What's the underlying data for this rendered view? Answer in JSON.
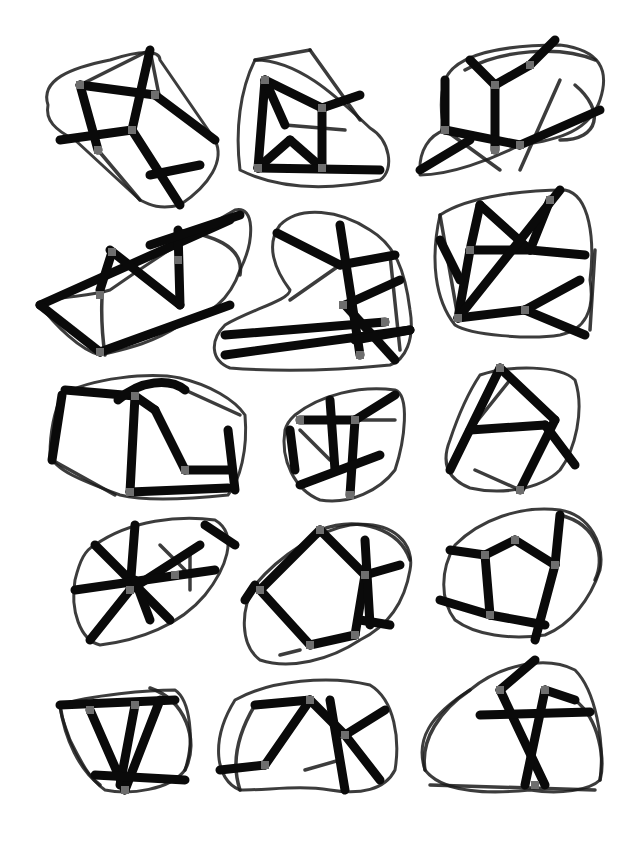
{
  "artwork": {
    "background": "#ffffff",
    "ink": "#0a0a0a",
    "joint_color": "#6e6e6e",
    "layout": {
      "columns": 3,
      "rows": 5
    },
    "shapes": [
      {
        "name": "shape-r1-c1",
        "outline": "M48,105 C40,80 70,68 110,60 C140,50 160,50 160,60 L215,140 C225,160 210,185 180,205 C160,210 150,205 140,200 L75,140 C55,130 45,120 48,105 Z",
        "thick": [
          "M132,130 L150,50",
          "M132,130 L60,140",
          "M132,130 L180,205",
          "M80,85 L98,150",
          "M80,85 L155,95",
          "M155,95 L215,140",
          "M150,175 L200,165"
        ],
        "thin": [
          "M150,50 L160,100",
          "M80,85 L150,50",
          "M98,150 L140,200"
        ],
        "joints": [
          [
            132,
            130
          ],
          [
            80,
            85
          ],
          [
            155,
            95
          ],
          [
            98,
            150
          ]
        ]
      },
      {
        "name": "shape-r2-c1",
        "outline": "M255,60 C240,90 235,130 240,170 C280,190 330,190 380,180 C395,170 390,140 370,128 C340,100 300,60 255,60 Z",
        "thick": [
          "M258,168 L265,80",
          "M265,80 L322,108",
          "M322,108 L360,95",
          "M322,108 L322,168",
          "M258,168 L290,140",
          "M290,140 L322,168",
          "M258,168 L380,170",
          "M265,80 L285,125"
        ],
        "thin": [
          "M255,60 L310,50",
          "M310,50 L360,120",
          "M285,125 L345,130"
        ],
        "joints": [
          [
            265,
            80
          ],
          [
            322,
            108
          ],
          [
            258,
            168
          ],
          [
            322,
            168
          ]
        ]
      },
      {
        "name": "shape-r3-c1",
        "outline": "M445,80 C455,55 500,45 560,45 C600,50 610,70 600,100 C590,130 560,140 520,145 C490,160 450,175 420,175 C418,150 430,135 445,130 C440,115 440,95 445,80 Z",
        "thick": [
          "M495,85 L470,60",
          "M495,85 L530,65",
          "M495,85 L495,150",
          "M530,65 L555,40",
          "M445,80 L445,130",
          "M445,130 L520,145",
          "M520,145 L600,110",
          "M420,170 L470,140"
        ],
        "thin": [
          "M465,70 C500,50 560,45 595,60",
          "M560,80 L520,170",
          "M445,130 L500,170",
          "M575,85 C605,110 600,140 560,140"
        ],
        "joints": [
          [
            495,
            85
          ],
          [
            530,
            65
          ],
          [
            445,
            130
          ],
          [
            520,
            145
          ],
          [
            495,
            150
          ]
        ]
      },
      {
        "name": "shape-r1-c2",
        "outline": "M40,305 C55,295 85,298 110,290 C160,255 200,230 235,210 C255,205 255,240 240,270 C230,300 210,315 180,325 C150,345 120,350 100,355 C80,350 55,325 40,305 Z",
        "thick": [
          "M40,305 L230,220",
          "M40,305 L100,352",
          "M100,352 L230,305",
          "M110,250 L180,305",
          "M180,305 L178,230",
          "M100,290 L112,252",
          "M150,245 L240,215"
        ],
        "thin": [
          "M110,252 C100,280 100,320 105,355",
          "M178,230 C210,235 245,245 240,275"
        ],
        "joints": [
          [
            112,
            252
          ],
          [
            178,
            260
          ],
          [
            100,
            295
          ],
          [
            100,
            352
          ]
        ]
      },
      {
        "name": "shape-r2-c2",
        "outline": "M280,225 C300,205 340,210 370,230 C395,245 405,270 410,310 C415,340 405,360 390,365 C340,370 280,372 230,368 C210,360 210,340 225,325 C250,310 290,300 290,290 C275,270 265,245 280,225 Z",
        "thick": [
          "M225,355 L410,330",
          "M225,335 L385,322",
          "M277,233 L340,265",
          "M340,265 L395,255",
          "M340,225 L360,355",
          "M345,305 L400,280",
          "M345,305 L395,360",
          "M355,340 L410,330"
        ],
        "thin": [
          "M290,300 L340,265",
          "M390,255 L400,350"
        ],
        "joints": [
          [
            343,
            305
          ],
          [
            385,
            322
          ],
          [
            360,
            355
          ]
        ]
      },
      {
        "name": "shape-r3-c2",
        "outline": "M440,215 C470,195 530,190 565,190 C590,195 595,240 590,280 C595,310 585,330 560,335 C530,340 470,335 455,325 C435,300 430,260 440,215 Z",
        "thick": [
          "M480,205 L470,250",
          "M470,250 L458,318",
          "M480,205 L530,250",
          "M530,250 L550,200",
          "M470,250 L530,250",
          "M530,250 L585,255",
          "M458,318 L525,310",
          "M525,310 L580,280",
          "M525,310 L585,335",
          "M458,318 L560,190",
          "M440,240 L460,280"
        ],
        "thin": [
          "M440,215 L458,318",
          "M595,250 L590,330"
        ],
        "joints": [
          [
            550,
            200
          ],
          [
            458,
            318
          ],
          [
            525,
            310
          ],
          [
            470,
            250
          ]
        ]
      },
      {
        "name": "shape-r1-c3",
        "outline": "M62,395 C90,378 150,372 180,378 C210,385 235,400 245,415 C248,450 240,480 228,495 C180,500 140,500 120,495 C80,480 55,470 50,455 C50,430 55,410 62,395 Z",
        "thick": [
          "M65,390 L135,396",
          "M135,396 L155,410",
          "M155,410 L185,470",
          "M185,470 L230,470",
          "M135,396 L130,492",
          "M130,492 L228,488",
          "M62,395 L52,460",
          "M228,430 L235,490",
          "M118,400 C140,380 170,378 185,390"
        ],
        "thin": [
          "M185,390 L240,415",
          "M52,460 L115,495"
        ],
        "joints": [
          [
            135,
            396
          ],
          [
            185,
            470
          ],
          [
            130,
            492
          ]
        ]
      },
      {
        "name": "shape-r2-c3",
        "outline": "M295,415 C320,395 360,385 395,390 C410,395 405,440 395,470 C380,490 350,505 320,500 C295,490 280,460 285,430 C288,420 292,418 295,415 Z",
        "thick": [
          "M300,420 L355,420",
          "M355,420 L395,395",
          "M355,420 L350,495",
          "M330,400 L335,470",
          "M300,485 L380,455",
          "M290,430 L295,470"
        ],
        "thin": [
          "M300,430 L330,460",
          "M350,420 L395,420"
        ],
        "joints": [
          [
            300,
            420
          ],
          [
            355,
            420
          ],
          [
            350,
            495
          ]
        ]
      },
      {
        "name": "shape-r3-c3",
        "outline": "M480,375 C510,365 560,365 575,380 C585,410 575,450 560,470 C540,490 500,495 470,488 C450,480 440,465 450,440 C460,410 470,390 480,375 Z",
        "thick": [
          "M500,368 L450,470",
          "M500,368 L555,420",
          "M555,420 L520,490",
          "M470,430 L545,425",
          "M545,425 L575,465"
        ],
        "thin": [
          "M520,490 L475,470",
          "M510,380 L470,430"
        ],
        "joints": [
          [
            500,
            368
          ],
          [
            520,
            490
          ]
        ]
      },
      {
        "name": "shape-r1-c4",
        "outline": "M95,545 C130,520 180,515 215,520 C240,535 225,570 205,595 C180,625 140,640 100,645 C80,640 70,610 75,580 C80,560 85,550 95,545 Z",
        "thick": [
          "M135,525 L130,590",
          "M95,545 L170,620",
          "M130,590 L90,640",
          "M130,590 L200,545",
          "M75,590 L215,570",
          "M150,620 L135,580",
          "M205,525 L235,545"
        ],
        "thin": [
          "M160,545 L185,570",
          "M190,550 L190,590"
        ],
        "joints": [
          [
            130,
            590
          ],
          [
            175,
            575
          ]
        ]
      },
      {
        "name": "shape-r2-c4",
        "outline": "M255,585 C280,555 320,530 350,525 C395,520 415,545 410,570 C405,600 390,625 360,640 C330,660 290,670 260,660 C240,645 240,610 255,585 Z",
        "thick": [
          "M260,590 L320,530",
          "M320,530 L365,575",
          "M365,575 L400,565",
          "M365,575 L355,635",
          "M355,635 L310,645",
          "M310,645 L260,590",
          "M365,540 L370,625",
          "M360,620 L390,625",
          "M245,600 L255,585"
        ],
        "thin": [
          "M320,530 C360,515 400,530 410,560",
          "M300,650 L280,655"
        ],
        "joints": [
          [
            260,
            590
          ],
          [
            320,
            530
          ],
          [
            365,
            575
          ],
          [
            310,
            645
          ],
          [
            355,
            635
          ]
        ]
      },
      {
        "name": "shape-r3-c4",
        "outline": "M455,545 C480,520 520,505 560,510 C590,515 605,545 600,570 C590,600 570,625 545,635 C510,640 475,635 455,620 C440,600 440,570 455,545 Z",
        "thick": [
          "M485,555 L515,540",
          "M515,540 L555,565",
          "M555,565 L560,515",
          "M555,565 L535,640",
          "M485,555 L490,615",
          "M490,615 L545,625",
          "M450,550 L485,555",
          "M440,600 L490,615"
        ],
        "thin": [
          "M560,515 C600,525 605,560 595,580"
        ],
        "joints": [
          [
            485,
            555
          ],
          [
            515,
            540
          ],
          [
            555,
            565
          ],
          [
            490,
            615
          ]
        ]
      },
      {
        "name": "shape-r1-c5",
        "outline": "M60,705 C90,695 150,690 175,690 C190,700 195,740 185,770 C170,790 130,795 105,790 C90,780 80,760 70,740 C65,725 60,715 60,705 Z",
        "thick": [
          "M60,705 L175,700",
          "M90,710 L125,790",
          "M135,705 L120,785",
          "M160,700 L125,790",
          "M95,775 L185,780"
        ],
        "thin": [
          "M150,688 C185,700 200,740 185,770",
          "M60,705 C65,740 80,770 100,785"
        ],
        "joints": [
          [
            90,
            710
          ],
          [
            135,
            705
          ],
          [
            125,
            790
          ]
        ]
      },
      {
        "name": "shape-r2-c5",
        "outline": "M235,700 C270,680 330,675 370,685 C395,700 400,740 395,770 C385,790 360,795 330,790 C300,785 270,790 240,790 C215,780 210,740 235,700 Z",
        "thick": [
          "M255,705 L310,700",
          "M310,700 L345,735",
          "M345,735 L385,710",
          "M345,735 L380,780",
          "M310,700 L265,765",
          "M265,765 L220,770",
          "M330,700 L345,790"
        ],
        "thin": [
          "M255,705 C240,730 230,760 240,790",
          "M305,770 L340,760"
        ],
        "joints": [
          [
            310,
            700
          ],
          [
            345,
            735
          ],
          [
            265,
            765
          ]
        ]
      },
      {
        "name": "shape-r3-c5",
        "outline": "M470,690 C500,665 545,655 575,670 C595,690 605,740 600,780 C590,790 560,795 530,790 C480,795 440,790 425,770 C415,740 430,715 470,690 Z",
        "thick": [
          "M500,690 L535,660",
          "M500,690 L545,785",
          "M545,690 L575,700",
          "M545,690 L525,785",
          "M480,715 L590,712"
        ],
        "thin": [
          "M470,690 C440,710 420,740 425,770",
          "M575,700 C600,720 605,760 600,780",
          "M430,785 L595,790"
        ],
        "joints": [
          [
            500,
            690
          ],
          [
            545,
            690
          ],
          [
            535,
            785
          ]
        ]
      }
    ]
  }
}
